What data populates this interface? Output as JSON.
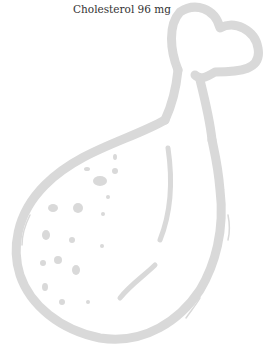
{
  "caption": "Cholesterol 96 mg",
  "illustration": {
    "subject": "chicken-drumstick-icon",
    "stroke_color": "#d9d9d9"
  }
}
